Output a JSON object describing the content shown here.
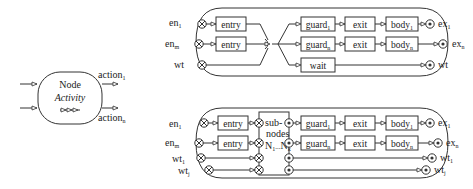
{
  "node": {
    "title": "Node",
    "subtitle": "Activity",
    "outputs": [
      {
        "label": "action",
        "sub": "1"
      },
      {
        "label": "action",
        "sub": "n"
      }
    ]
  },
  "top_diagram": {
    "inputs": [
      {
        "label": "en",
        "sub": "1"
      },
      {
        "label": "en",
        "sub": "m"
      },
      {
        "label": "wt",
        "sub": ""
      }
    ],
    "entry_boxes": [
      "entry",
      "entry"
    ],
    "guard_boxes": [
      {
        "label": "guard",
        "sub": "1"
      },
      {
        "label": "guard",
        "sub": "n"
      }
    ],
    "wait_box": "wait",
    "exit_boxes": [
      "exit",
      "exit"
    ],
    "body_boxes": [
      {
        "label": "body",
        "sub": "1"
      },
      {
        "label": "body",
        "sub": "n"
      }
    ],
    "outputs": [
      {
        "label": "ex",
        "sub": "1"
      },
      {
        "label": "ex",
        "sub": "n"
      },
      {
        "label": "wt",
        "sub": ""
      }
    ]
  },
  "bottom_diagram": {
    "inputs": [
      {
        "label": "en",
        "sub": "1"
      },
      {
        "label": "en",
        "sub": "m"
      },
      {
        "label": "wt",
        "sub": "1"
      },
      {
        "label": "wt",
        "sub": "j"
      }
    ],
    "entry_boxes": [
      "entry",
      "entry"
    ],
    "subnodes": {
      "line1": "sub-",
      "line2": "nodes",
      "line3": "N",
      "sub_a": "1",
      "dots": "...",
      "line3b": "N",
      "sub_b": "k"
    },
    "guard_boxes": [
      {
        "label": "guard",
        "sub": "1"
      },
      {
        "label": "guard",
        "sub": "n"
      }
    ],
    "exit_boxes": [
      "exit",
      "exit"
    ],
    "body_boxes": [
      {
        "label": "body",
        "sub": "1"
      },
      {
        "label": "body",
        "sub": "n"
      }
    ],
    "outputs": [
      {
        "label": "ex",
        "sub": "1"
      },
      {
        "label": "ex",
        "sub": "n"
      },
      {
        "label": "wt",
        "sub": "1"
      },
      {
        "label": "wt",
        "sub": "j"
      }
    ]
  }
}
